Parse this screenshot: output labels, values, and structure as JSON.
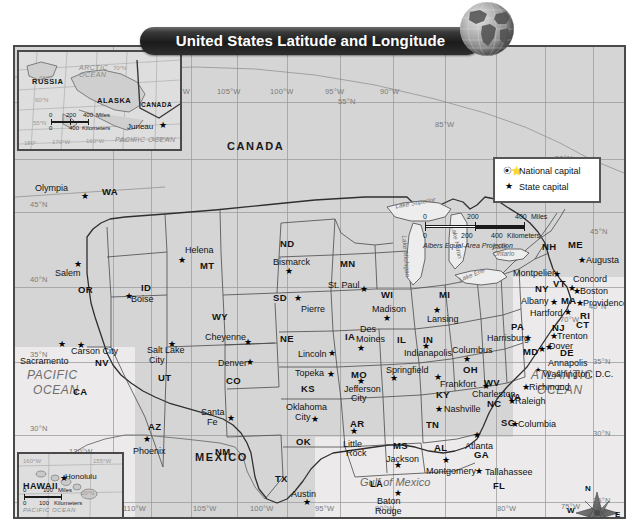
{
  "title": "United States Latitude and Longitude",
  "legend": {
    "national": {
      "label": "National capital",
      "icon": "circled-star-icon"
    },
    "state": {
      "label": "State capital",
      "icon": "star-icon"
    }
  },
  "scale": {
    "miles": {
      "zero": "0",
      "mid": "200",
      "end": "400",
      "unit": "Miles"
    },
    "km": {
      "zero": "0",
      "mid": "200",
      "end": "400",
      "unit": "Kilometers"
    },
    "projection": "Albers Equal-Area Projection"
  },
  "compass": {
    "n": "N",
    "e": "E",
    "s": "S",
    "w": "W"
  },
  "countries": [
    "CANADA",
    "MEXICO"
  ],
  "oceans": {
    "pacific": "PACIFIC\nOCEAN",
    "pacific_l1": "PACIFIC",
    "pacific_l2": "OCEAN",
    "atlantic_l1": "ATLANTIC",
    "atlantic_l2": "OCEAN",
    "gulf": "Gulf of Mexico"
  },
  "lakes": [
    "Lake Superior",
    "Lake Michigan",
    "Lake Huron",
    "Lake Erie",
    "Lake Ontario"
  ],
  "longitudes_top": [
    "110°W",
    "105°W",
    "100°W",
    "95°W",
    "90°W",
    "85°W"
  ],
  "longitudes_bottom": [
    "110°W",
    "105°W",
    "100°W",
    "95°W",
    "90°W",
    "85°W",
    "80°W",
    "75°W"
  ],
  "longitudes_right": [
    "70°W",
    "75°W"
  ],
  "longitude_left": "120°W",
  "latitudes_left": [
    "45°N",
    "40°N",
    "35°N",
    "30°N"
  ],
  "latitudes_right": [
    "45°N",
    "40°N",
    "35°N",
    "30°N",
    "25°N"
  ],
  "latitudes_mid": [
    "55°N",
    "50°N"
  ],
  "alaska_inset": {
    "region": "ALASKA",
    "neighbors": [
      "RUSSIA",
      "CANADA"
    ],
    "capital": "Juneau",
    "oceans": [
      "ARCTIC OCEAN",
      "PACIFIC OCEAN"
    ],
    "lats": [
      "70°N",
      "65°N",
      "60°N",
      "55°N"
    ],
    "lons": [
      "180°",
      "170°W",
      "160°W",
      "150°W",
      "140°W"
    ],
    "scale": {
      "zero": "0",
      "mid": "200",
      "end": "400",
      "miles": "Miles",
      "km": "Kilometers",
      "kzero": "0",
      "kend": "400"
    }
  },
  "hawaii_inset": {
    "region": "HAWAII",
    "capital": "Honolulu",
    "ocean": "PACIFIC OCEAN",
    "lats": [
      "20°N"
    ],
    "lons": [
      "160°W",
      "155°W"
    ],
    "scale": {
      "zero": "0",
      "end": "100",
      "miles": "Miles",
      "km": "Kilometers",
      "kzero": "0",
      "kend": "100"
    }
  },
  "states": [
    {
      "abbr": "WA",
      "capital": "Olympia"
    },
    {
      "abbr": "OR",
      "capital": "Salem"
    },
    {
      "abbr": "MT",
      "capital": "Helena"
    },
    {
      "abbr": "ID",
      "capital": "Boise"
    },
    {
      "abbr": "ND",
      "capital": "Bismarck"
    },
    {
      "abbr": "MN",
      "capital": "St. Paul"
    },
    {
      "abbr": "SD",
      "capital": "Pierre"
    },
    {
      "abbr": "WI",
      "capital": "Madison"
    },
    {
      "abbr": "WY",
      "capital": "Cheyenne"
    },
    {
      "abbr": "NE",
      "capital": "Lincoln"
    },
    {
      "abbr": "IA",
      "capital": "Des Moines"
    },
    {
      "abbr": "MI",
      "capital": "Lansing"
    },
    {
      "abbr": "NV",
      "capital": "Carson City"
    },
    {
      "abbr": "UT",
      "capital": "Salt Lake City"
    },
    {
      "abbr": "CO",
      "capital": "Denver"
    },
    {
      "abbr": "KS",
      "capital": "Topeka"
    },
    {
      "abbr": "MO",
      "capital": "Jefferson City"
    },
    {
      "abbr": "IL",
      "capital": "Springfield"
    },
    {
      "abbr": "IN",
      "capital": "Indianapolis"
    },
    {
      "abbr": "OH",
      "capital": "Columbus"
    },
    {
      "abbr": "PA",
      "capital": "Harrisburg"
    },
    {
      "abbr": "NY",
      "capital": "Albany"
    },
    {
      "abbr": "VT",
      "capital": "Montpelier"
    },
    {
      "abbr": "NH",
      "capital": "Concord"
    },
    {
      "abbr": "ME",
      "capital": "Augusta"
    },
    {
      "abbr": "MA",
      "capital": "Boston"
    },
    {
      "abbr": "RI",
      "capital": "Providence"
    },
    {
      "abbr": "CT",
      "capital": "Hartford"
    },
    {
      "abbr": "NJ",
      "capital": "Trenton"
    },
    {
      "abbr": "DE",
      "capital": "Dover"
    },
    {
      "abbr": "MD",
      "capital": "Annapolis"
    },
    {
      "abbr": "WV",
      "capital": "Charleston"
    },
    {
      "abbr": "VA",
      "capital": "Richmond"
    },
    {
      "abbr": "KY",
      "capital": "Frankfort"
    },
    {
      "abbr": "NC",
      "capital": "Raleigh"
    },
    {
      "abbr": "SC",
      "capital": "Columbia"
    },
    {
      "abbr": "TN",
      "capital": "Nashville"
    },
    {
      "abbr": "GA",
      "capital": "Atlanta"
    },
    {
      "abbr": "AL",
      "capital": "Montgomery"
    },
    {
      "abbr": "MS",
      "capital": "Jackson"
    },
    {
      "abbr": "AR",
      "capital": "Little Rock"
    },
    {
      "abbr": "LA",
      "capital": "Baton Rouge"
    },
    {
      "abbr": "OK",
      "capital": "Oklahoma City"
    },
    {
      "abbr": "TX",
      "capital": "Austin"
    },
    {
      "abbr": "NM",
      "capital": "Santa Fe"
    },
    {
      "abbr": "AZ",
      "capital": "Phoenix"
    },
    {
      "abbr": "CA",
      "capital": "Sacramento"
    },
    {
      "abbr": "FL",
      "capital": "Tallahassee"
    }
  ],
  "national_capital": "Washington, D.C.",
  "map_labels": {
    "olympia": "Olympia",
    "wa": "WA",
    "salem": "Salem",
    "or": "OR",
    "helena": "Helena",
    "mt": "MT",
    "boise": "Boise",
    "id": "ID",
    "bismarck": "Bismarck",
    "nd": "ND",
    "stpaul": "St. Paul",
    "mn": "MN",
    "pierre": "Pierre",
    "sd": "SD",
    "madison": "Madison",
    "wi": "WI",
    "cheyenne": "Cheyenne",
    "wy": "WY",
    "lincoln": "Lincoln",
    "ne": "NE",
    "desmoines1": "Des",
    "desmoines2": "Moines",
    "ia": "IA",
    "lansing": "Lansing",
    "mi": "MI",
    "carsoncity": "Carson City",
    "nv": "NV",
    "saltlake1": "Salt Lake",
    "saltlake2": "City",
    "ut": "UT",
    "denver": "Denver",
    "co": "CO",
    "topeka": "Topeka",
    "ks": "KS",
    "jefferson1": "Jefferson",
    "jefferson2": "City",
    "mo": "MO",
    "springfield": "Springfield",
    "il": "IL",
    "indianapolis": "Indianapolis",
    "in": "IN",
    "columbus": "Columbus",
    "oh": "OH",
    "harrisburg": "Harrisburg",
    "pa": "PA",
    "albany": "Albany",
    "ny": "NY",
    "montpelier": "Montpelier",
    "vt": "VT",
    "concord": "Concord",
    "nh": "NH",
    "augusta": "Augusta",
    "me": "ME",
    "boston": "Boston",
    "ma": "MA",
    "providence": "Providence",
    "ri": "RI",
    "hartford": "Hartford",
    "ct": "CT",
    "trenton": "Trenton",
    "nj": "NJ",
    "dover": "Dover",
    "de": "DE",
    "annapolis": "Annapolis",
    "md": "MD",
    "charleston": "Charleston",
    "wv": "WV",
    "richmond": "Richmond",
    "va": "VA",
    "frankfort": "Frankfort",
    "ky": "KY",
    "raleigh": "Raleigh",
    "nc": "NC",
    "columbia": "Columbia",
    "sc": "SC",
    "nashville": "Nashville",
    "tn": "TN",
    "atlanta": "Atlanta",
    "ga": "GA",
    "montgomery": "Montgomery",
    "al": "AL",
    "jackson": "Jackson",
    "ms": "MS",
    "littlerock1": "Little",
    "littlerock2": "Rock",
    "ar": "AR",
    "batonrouge1": "Baton",
    "batonrouge2": "Rouge",
    "la": "LA",
    "okc1": "Oklahoma",
    "okc2": "City",
    "ok": "OK",
    "austin": "Austin",
    "tx": "TX",
    "santafe1": "Santa",
    "santafe2": "Fe",
    "nm": "NM",
    "phoenix": "Phoenix",
    "az": "AZ",
    "sacramento": "Sacramento",
    "ca": "CA",
    "tallahassee": "Tallahassee",
    "fl": "FL",
    "dc": "Washington, D.C."
  }
}
